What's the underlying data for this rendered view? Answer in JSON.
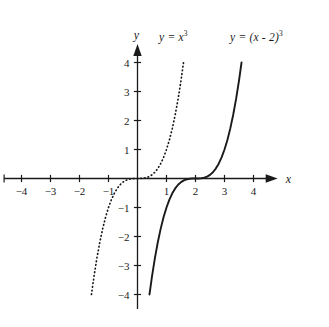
{
  "chart_data": {
    "type": "line",
    "title": "",
    "xlabel": "x",
    "ylabel": "y",
    "xlim": [
      -4.6,
      4.8
    ],
    "ylim": [
      -4.5,
      4.6
    ],
    "grid": false,
    "legend_position": "inline-annotations",
    "x_ticks": [
      -4,
      -3,
      -2,
      -1,
      1,
      2,
      3,
      4
    ],
    "y_ticks": [
      -4,
      -3,
      -2,
      -1,
      1,
      2,
      3,
      4
    ],
    "x_tick_labels": [
      "−4",
      "−3",
      "−2",
      "−1",
      "1",
      "2",
      "3",
      "4"
    ],
    "y_tick_labels": [
      "−4",
      "−3",
      "−2",
      "−1",
      "1",
      "2",
      "3",
      "4"
    ],
    "series": [
      {
        "name": "y = x^3",
        "style": "dotted",
        "color": "#1a1a1a",
        "x_domain": [
          -1.5874,
          1.5874
        ],
        "x": [
          -1.5874,
          -1.5,
          -1.4,
          -1.3,
          -1.2,
          -1.1,
          -1.0,
          -0.9,
          -0.8,
          -0.7,
          -0.6,
          -0.5,
          -0.4,
          -0.3,
          -0.2,
          -0.1,
          0.0,
          0.1,
          0.2,
          0.3,
          0.4,
          0.5,
          0.6,
          0.7,
          0.8,
          0.9,
          1.0,
          1.1,
          1.2,
          1.3,
          1.4,
          1.5,
          1.5874
        ],
        "values": [
          -4.0,
          -3.375,
          -2.744,
          -2.197,
          -1.728,
          -1.331,
          -1.0,
          -0.729,
          -0.512,
          -0.343,
          -0.216,
          -0.125,
          -0.064,
          -0.027,
          -0.008,
          -0.001,
          0.0,
          0.001,
          0.008,
          0.027,
          0.064,
          0.125,
          0.216,
          0.343,
          0.512,
          0.729,
          1.0,
          1.331,
          1.728,
          2.197,
          2.744,
          3.375,
          4.0
        ]
      },
      {
        "name": "y = (x - 2)^3",
        "style": "solid",
        "color": "#1a1a1a",
        "x_domain": [
          0.4126,
          3.5874
        ],
        "x": [
          0.4126,
          0.5,
          0.6,
          0.7,
          0.8,
          0.9,
          1.0,
          1.1,
          1.2,
          1.3,
          1.4,
          1.5,
          1.6,
          1.7,
          1.8,
          1.9,
          2.0,
          2.1,
          2.2,
          2.3,
          2.4,
          2.5,
          2.6,
          2.7,
          2.8,
          2.9,
          3.0,
          3.1,
          3.2,
          3.3,
          3.4,
          3.5,
          3.5874
        ],
        "values": [
          -4.0,
          -3.375,
          -2.744,
          -2.197,
          -1.728,
          -1.331,
          -1.0,
          -0.729,
          -0.512,
          -0.343,
          -0.216,
          -0.125,
          -0.064,
          -0.027,
          -0.008,
          -0.001,
          0.0,
          0.001,
          0.008,
          0.027,
          0.064,
          0.125,
          0.216,
          0.343,
          0.512,
          0.729,
          1.0,
          1.331,
          1.728,
          2.197,
          2.744,
          3.375,
          4.0
        ]
      }
    ],
    "annotations": [
      {
        "id": "label-xcubed",
        "text": "y = x",
        "exponent": "3",
        "refers_to": "y = x^3"
      },
      {
        "id": "label-xminus2cubed",
        "text": "y = (x - 2)",
        "exponent": "3",
        "refers_to": "y = (x - 2)^3"
      }
    ]
  },
  "axes": {
    "x_axis_label": "x",
    "y_axis_label": "y"
  },
  "colors": {
    "background": "#ffffff",
    "axis": "#1a1a1a",
    "curve": "#1a1a1a",
    "text": "#1a1a1a"
  }
}
